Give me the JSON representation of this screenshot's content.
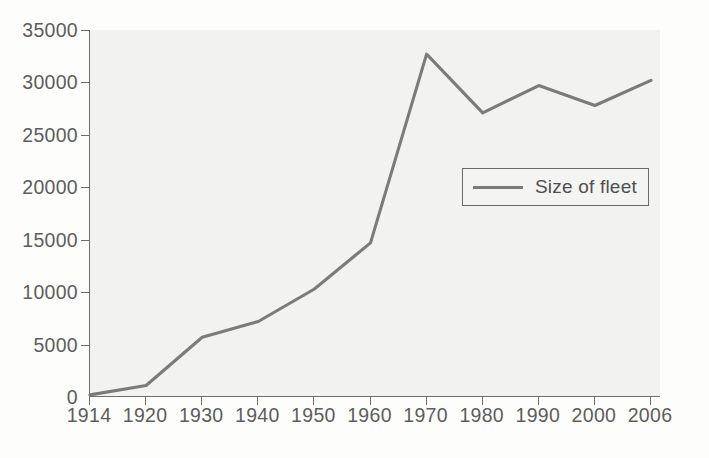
{
  "chart_data": {
    "type": "line",
    "title": "",
    "subtitle": "",
    "xlabel": "",
    "ylabel": "",
    "categories": [
      "1914",
      "1920",
      "1930",
      "1940",
      "1950",
      "1960",
      "1970",
      "1980",
      "1990",
      "2000",
      "2006"
    ],
    "x": [
      1914,
      1920,
      1930,
      1940,
      1950,
      1960,
      1970,
      1980,
      1990,
      2000,
      2006
    ],
    "series": [
      {
        "name": "Size of fleet",
        "values": [
          200,
          1100,
          5700,
          7200,
          10300,
          14700,
          32700,
          27100,
          29700,
          27800,
          30200
        ],
        "color": "#7b7b7b"
      }
    ],
    "ylim": [
      0,
      35000
    ],
    "xlim": [
      1914,
      2006
    ],
    "yticks": [
      0,
      5000,
      10000,
      15000,
      20000,
      25000,
      30000,
      35000
    ],
    "ytick_labels": [
      "0",
      "5000",
      "10000",
      "15000",
      "20000",
      "25000",
      "30000",
      "35000"
    ],
    "xtick_labels": [
      "1914",
      "1920",
      "1930",
      "1940",
      "1950",
      "1960",
      "1970",
      "1980",
      "1990",
      "2000",
      "2006"
    ],
    "grid": false,
    "legend_position": "center-right",
    "legend_entries": [
      "Size of fleet"
    ],
    "plot_background": "#f2f2f0",
    "axis_color": "#6e6e6e",
    "text_color": "#5d5d5d"
  },
  "legend": {
    "label": "Size of fleet"
  }
}
